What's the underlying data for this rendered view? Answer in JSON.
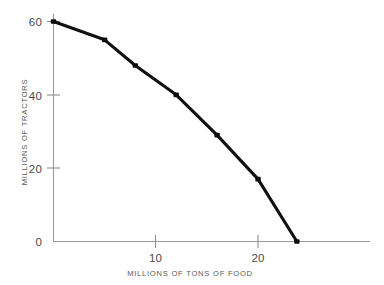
{
  "chart_data": {
    "type": "line",
    "title": "",
    "xlabel": "MILLIONS OF TONS OF FOOD",
    "ylabel": "MILLIONS OF TRACTORS",
    "xlim": [
      0,
      30.8
    ],
    "ylim": [
      0,
      62.2
    ],
    "grid": false,
    "legend": null,
    "xticks": [
      0,
      10,
      20
    ],
    "xtick_labels": [
      "0",
      "10",
      "20"
    ],
    "yticks": [
      0,
      20,
      40,
      60
    ],
    "ytick_labels": [
      "0",
      "20",
      "40",
      "60"
    ],
    "series": [
      {
        "name": "production-possibilities-frontier",
        "color": "#0d0d0d",
        "x": [
          0,
          5,
          8,
          12,
          16,
          20,
          23.8
        ],
        "y": [
          60,
          55,
          48,
          40,
          29,
          17,
          0
        ]
      }
    ]
  },
  "axes": {
    "x_title": "MILLIONS OF TONS OF FOOD",
    "y_title": "MILLIONS OF TRACTORS",
    "x_tick_0": "0",
    "x_tick_10": "10",
    "x_tick_20": "20",
    "y_tick_0": "0",
    "y_tick_20": "20",
    "y_tick_40": "40",
    "y_tick_60": "60"
  }
}
